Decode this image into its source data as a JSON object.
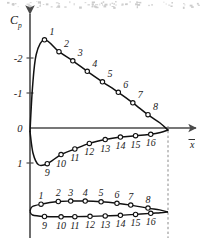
{
  "figure": {
    "kind": "pressure-distribution-over-airfoil",
    "axis_label_y": "Cp",
    "axis_label_y_main": "C",
    "axis_label_y_sub": "p",
    "axis_label_x": "x",
    "axis_label_x_overbar": true,
    "colors": {
      "ink": "#1a1a1a",
      "axis": "#4a4a4a",
      "curve": "#111111",
      "marker_fill": "#ffffff",
      "dashed": "#8a8a8a"
    }
  },
  "chart_data": {
    "type": "line",
    "title": "",
    "subtitle": "",
    "xlabel": "x",
    "ylabel": "Cp",
    "grid": false,
    "legend": "none",
    "y_inverted": true,
    "xlim": [
      0,
      1
    ],
    "ylim": [
      -2.75,
      1.25
    ],
    "y_ticks": [
      -2,
      -1,
      0,
      1
    ],
    "y_tick_labels": [
      "-2",
      "-1",
      "0",
      "1"
    ],
    "x_ticks": [],
    "x_tick_labels": [],
    "annotations": [
      "Dashed vertical line at trailing edge linking Cp plot to airfoil section",
      "Point numbers 1-8 label upper (suction) surface, 9-16 label lower (pressure) surface"
    ],
    "series": [
      {
        "name": "upper-surface-cp",
        "point_labels": [
          "1",
          "2",
          "3",
          "4",
          "5",
          "6",
          "7",
          "8"
        ],
        "x": [
          0.105,
          0.21,
          0.31,
          0.415,
          0.525,
          0.64,
          0.745,
          0.855
        ],
        "y": [
          -2.52,
          -2.18,
          -1.92,
          -1.62,
          -1.32,
          -1.02,
          -0.72,
          -0.38
        ],
        "label_offsets": [
          "above-right",
          "above-right",
          "above-right",
          "above-right",
          "above-right",
          "above-right",
          "above-right",
          "above-right"
        ]
      },
      {
        "name": "lower-surface-cp",
        "point_labels": [
          "9",
          "10",
          "11",
          "12",
          "13",
          "14",
          "15",
          "16"
        ],
        "x": [
          0.125,
          0.225,
          0.325,
          0.43,
          0.545,
          0.655,
          0.765,
          0.875
        ],
        "y": [
          1.02,
          0.76,
          0.6,
          0.44,
          0.33,
          0.26,
          0.22,
          0.18
        ],
        "label_offsets": [
          "below",
          "below",
          "below",
          "below",
          "below",
          "below",
          "below",
          "below"
        ]
      }
    ]
  },
  "airfoil": {
    "name": "airfoil-section",
    "chord_start": 0.0,
    "chord_end": 1.0,
    "upper_labels": [
      "1",
      "2",
      "3",
      "4",
      "5",
      "6",
      "7",
      "8"
    ],
    "lower_labels": [
      "9",
      "10",
      "11",
      "12",
      "13",
      "14",
      "15",
      "16"
    ],
    "upper_x": [
      0.08,
      0.205,
      0.295,
      0.4,
      0.515,
      0.63,
      0.73,
      0.855
    ],
    "upper_y": [
      0.052,
      0.07,
      0.073,
      0.073,
      0.068,
      0.058,
      0.046,
      0.026
    ],
    "lower_x": [
      0.105,
      0.225,
      0.325,
      0.435,
      0.545,
      0.655,
      0.765,
      0.875
    ],
    "lower_y": [
      -0.03,
      -0.032,
      -0.031,
      -0.029,
      -0.026,
      -0.022,
      -0.016,
      -0.009
    ]
  }
}
